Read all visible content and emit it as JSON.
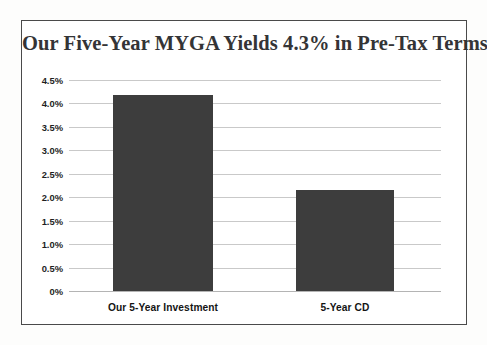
{
  "card": {
    "border_color": "#4a4a4a",
    "background": "#ffffff"
  },
  "chart_data": {
    "type": "bar",
    "title": "Our Five-Year MYGA Yields 4.3% in Pre-Tax Terms",
    "xlabel": "",
    "ylabel": "",
    "categories": [
      "Our 5-Year Investment",
      "5-Year CD"
    ],
    "values": [
      4.17,
      2.15
    ],
    "value_labels": [
      "",
      ""
    ],
    "ylim": [
      0,
      4.5
    ],
    "ytick_values": [
      4.5,
      4.0,
      3.5,
      3.0,
      2.5,
      2.0,
      1.5,
      1.0,
      0.5,
      0
    ],
    "ytick_labels": [
      "4.5%",
      "4.0%",
      "3.5%",
      "3.0%",
      "2.5%",
      "2.0%",
      "1.5%",
      "1.0%",
      "0.5%",
      "0%"
    ],
    "grid": true,
    "grid_color": "#c9c9c9",
    "legend": false,
    "bar_color": "#3d3d3d",
    "title_color": "#343436",
    "tick_color": "#1f1f1f"
  }
}
